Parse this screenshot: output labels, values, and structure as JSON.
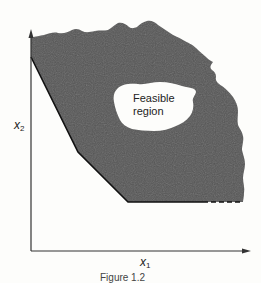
{
  "figure": {
    "region_label_line1": "Feasible",
    "region_label_line2": "region",
    "x_axis_label": "x",
    "x_axis_subscript": "1",
    "y_axis_label": "x",
    "y_axis_subscript": "2",
    "caption": "Figure 1.2",
    "colors": {
      "infeasible_fill": "#555555",
      "feasible_fill": "#fdfdfb",
      "axis": "#333333",
      "boundary": "#111111",
      "background": "#fdfdfb"
    }
  }
}
